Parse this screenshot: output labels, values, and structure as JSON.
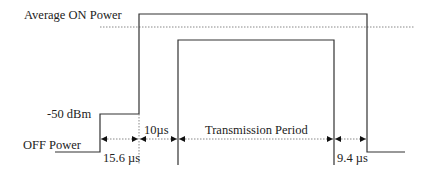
{
  "diagram": {
    "labels": {
      "average_on_power": "Average ON Power",
      "minus_50_dbm": "-50 dBm",
      "off_power": "OFF Power",
      "t_15_6": "15.6 µs",
      "t_10": "10µs",
      "transmission_period": "Transmission Period",
      "t_9_4": "9.4 µs"
    },
    "colors": {
      "line": "#333333",
      "dotted": "#888888"
    }
  }
}
